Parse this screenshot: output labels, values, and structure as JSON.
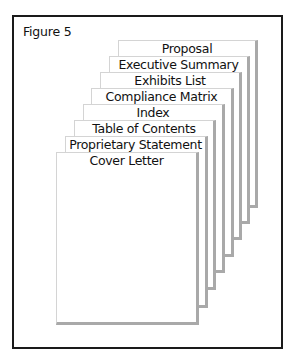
{
  "figure": {
    "title": "Figure 5",
    "pages": [
      {
        "label": "Proposal",
        "left": 118,
        "top": 40,
        "right": 258,
        "bottom": 208
      },
      {
        "label": "Executive Summary",
        "left": 109,
        "top": 56,
        "right": 250,
        "bottom": 224
      },
      {
        "label": "Exhibits List",
        "left": 100,
        "top": 72,
        "right": 242,
        "bottom": 240
      },
      {
        "label": "Compliance Matrix",
        "left": 91,
        "top": 88,
        "right": 234,
        "bottom": 257
      },
      {
        "label": "Index",
        "left": 83,
        "top": 104,
        "right": 225,
        "bottom": 273
      },
      {
        "label": "Table of Contents",
        "left": 74,
        "top": 120,
        "right": 216,
        "bottom": 290
      },
      {
        "label": "Proprietary Statement",
        "left": 65,
        "top": 136,
        "right": 208,
        "bottom": 308
      },
      {
        "label": "Cover Letter",
        "left": 56,
        "top": 152,
        "right": 199,
        "bottom": 325
      }
    ],
    "colors": {
      "frame": "#1a1a1a",
      "page_shadow": "#a9a9a9",
      "page_edge": "#d4d4d4"
    }
  }
}
